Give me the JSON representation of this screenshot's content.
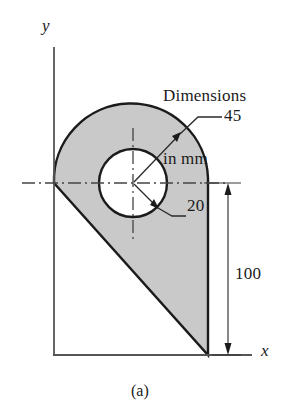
{
  "figure": {
    "caption": "(a)",
    "note": {
      "line1": "Dimensions",
      "line2": "in mm"
    },
    "axes": {
      "x_label": "x",
      "y_label": "y"
    },
    "dimensions": [
      {
        "id": "outer-radius",
        "value": "45",
        "unit": "mm",
        "kind": "radius"
      },
      {
        "id": "hole-radius",
        "value": "20",
        "unit": "mm",
        "kind": "radius"
      },
      {
        "id": "overall-height",
        "value": "100",
        "unit": "mm",
        "kind": "linear"
      }
    ],
    "colors": {
      "shaded_fill": "#c9c9c9",
      "outline": "#1b1b1b",
      "axis": "#555555",
      "center_line": "#444444",
      "background": "#ffffff"
    },
    "geometry": {
      "center": {
        "x": 133,
        "y": 183
      },
      "outer_radius_px": 76,
      "hole_radius_px": 34,
      "origin": {
        "x": 54,
        "y": 183
      },
      "baseline_y": 355,
      "right_edge_x": 208
    }
  }
}
